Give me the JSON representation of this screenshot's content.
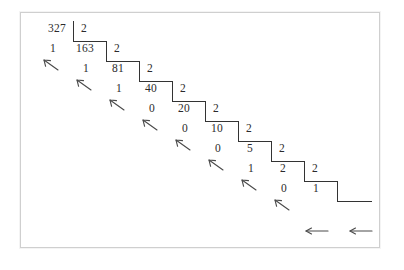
{
  "figure": {
    "kind": "repeated-division-diagram",
    "dividend": "327",
    "divisor": "2",
    "frame_color": "#cfcfcf",
    "ink_color": "#2b2b2b",
    "background": "#ffffff"
  },
  "rows": [
    {
      "remainder": "",
      "quotient": "327",
      "divisor": "2",
      "arrow": ""
    },
    {
      "remainder": "1",
      "quotient": "163",
      "divisor": "2",
      "arrow": ""
    },
    {
      "remainder": "1",
      "quotient": "81",
      "divisor": "2",
      "arrow": "arrow-up-left"
    },
    {
      "remainder": "1",
      "quotient": "40",
      "divisor": "2",
      "arrow": "arrow-up-left"
    },
    {
      "remainder": "0",
      "quotient": "20",
      "divisor": "2",
      "arrow": "arrow-up-left"
    },
    {
      "remainder": "0",
      "quotient": "10",
      "divisor": "2",
      "arrow": "arrow-up-left"
    },
    {
      "remainder": "0",
      "quotient": "5",
      "divisor": "2",
      "arrow": "arrow-up-left"
    },
    {
      "remainder": "1",
      "quotient": "2",
      "divisor": "2",
      "arrow": "arrow-up-left"
    },
    {
      "remainder": "0",
      "quotient": "1",
      "divisor": "",
      "arrow": "arrow-up-left"
    }
  ],
  "labels": {
    "n327": "327",
    "n163": "163",
    "n81": "81",
    "n40": "40",
    "n20": "20",
    "n10": "10",
    "n5": "5",
    "n2": "2",
    "n1": "1",
    "d0": "2",
    "d1": "2",
    "d2": "2",
    "d3": "2",
    "d4": "2",
    "d5": "2",
    "d6": "2",
    "d7": "2",
    "d8": "2",
    "r1": "1",
    "r2": "1",
    "r3": "1",
    "r4": "0",
    "r5": "0",
    "r6": "0",
    "r7": "1",
    "r8": "0",
    "last1": "1"
  },
  "bottom_arrows": [
    {
      "name": "arrow-left-1",
      "glyph": "left-arrow"
    },
    {
      "name": "arrow-left-2",
      "glyph": "left-arrow"
    }
  ]
}
